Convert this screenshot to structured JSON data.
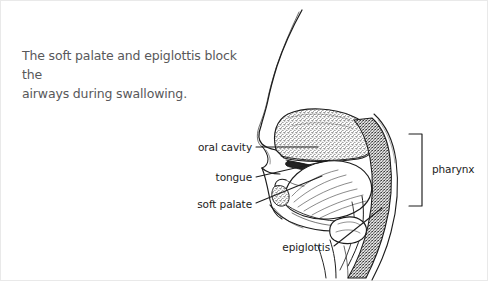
{
  "figure": {
    "caption": "The soft palate and epiglottis block the\nairways during swallowing.",
    "view": "mid-sagittal section of human head and neck",
    "style": "black-and-white stippled line drawing",
    "ink_color": "#1c1c1c",
    "caption_color": "#58585a",
    "background_color": "#ffffff",
    "frame_color": "#e9e9e9"
  },
  "labels": {
    "oral_cavity": "oral cavity",
    "tongue": "tongue",
    "soft_palate": "soft palate",
    "epiglottis": "epiglottis",
    "pharynx": "pharynx"
  },
  "leaders": [
    {
      "label": "oral cavity",
      "from": [
        256,
        147
      ],
      "to": [
        318,
        147
      ]
    },
    {
      "label": "tongue",
      "from": [
        256,
        177
      ],
      "to": [
        330,
        160
      ]
    },
    {
      "label": "soft palate",
      "from": [
        256,
        203
      ],
      "to": [
        322,
        176
      ]
    },
    {
      "label": "epiglottis",
      "from": [
        334,
        246
      ],
      "to": [
        382,
        208
      ]
    }
  ],
  "bracket": {
    "label": "pharynx",
    "orientation": "opens-left",
    "x": 409,
    "top": 134,
    "bottom": 206,
    "depth": 13
  }
}
